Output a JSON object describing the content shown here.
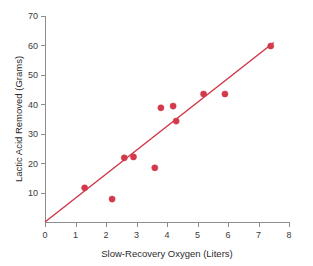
{
  "chart_data": {
    "type": "scatter",
    "title": "",
    "xlabel": "Slow-Recovery Oxygen (Liters)",
    "ylabel": "Lactic Acid Removed (Grams)",
    "xlim": [
      0,
      8
    ],
    "ylim": [
      0,
      70
    ],
    "xticks": [
      0,
      1,
      2,
      3,
      4,
      5,
      6,
      7,
      8
    ],
    "yticks": [
      10,
      20,
      30,
      40,
      50,
      60,
      70
    ],
    "xtick_labels": [
      "0",
      "1",
      "2",
      "3",
      "4",
      "5",
      "6",
      "7",
      "8"
    ],
    "ytick_labels": [
      "10",
      "20",
      "30",
      "40",
      "50",
      "60",
      "70"
    ],
    "grid": false,
    "legend": false,
    "point_color": "#d23a4c",
    "line_color": "#cf3346",
    "axis_color": "#8d8d8d",
    "background": "#ffffff",
    "points": [
      {
        "x": 1.3,
        "y": 11.6
      },
      {
        "x": 2.2,
        "y": 7.8
      },
      {
        "x": 2.6,
        "y": 21.8
      },
      {
        "x": 2.9,
        "y": 22.1
      },
      {
        "x": 3.6,
        "y": 18.4
      },
      {
        "x": 3.8,
        "y": 38.8
      },
      {
        "x": 4.2,
        "y": 39.4
      },
      {
        "x": 4.3,
        "y": 34.3
      },
      {
        "x": 5.2,
        "y": 43.5
      },
      {
        "x": 5.9,
        "y": 43.5
      },
      {
        "x": 7.4,
        "y": 59.8
      }
    ],
    "fit_line": {
      "name": "least-squares regression line",
      "x": [
        0,
        7.5
      ],
      "y": [
        0,
        61
      ]
    }
  },
  "figure": {
    "width": 313,
    "height": 266
  }
}
